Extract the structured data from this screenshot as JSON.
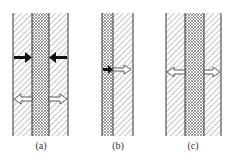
{
  "figure": {
    "panels": [
      {
        "id": "a",
        "label": "(a)",
        "layers": [
          "hatched-wall",
          "crosshatched-core",
          "hatched-wall"
        ],
        "arrows": [
          {
            "type": "solid",
            "direction": "inward",
            "side": "left"
          },
          {
            "type": "solid",
            "direction": "inward",
            "side": "right"
          },
          {
            "type": "hollow",
            "direction": "outward",
            "side": "left"
          },
          {
            "type": "hollow",
            "direction": "outward",
            "side": "right"
          }
        ]
      },
      {
        "id": "b",
        "label": "(b)",
        "layers": [
          "crosshatched-core",
          "hatched-wall"
        ],
        "arrows": [
          {
            "type": "solid-to-hollow",
            "direction": "rightward",
            "side": "interface"
          }
        ]
      },
      {
        "id": "c",
        "label": "(c)",
        "layers": [
          "hatched-wall",
          "crosshatched-core",
          "hatched-wall"
        ],
        "arrows": [
          {
            "type": "hollow",
            "direction": "outward",
            "side": "left"
          },
          {
            "type": "hollow",
            "direction": "outward",
            "side": "right"
          }
        ]
      }
    ],
    "colors": {
      "line": "#333333",
      "hatch": "#888888",
      "background": "#ffffff"
    }
  }
}
